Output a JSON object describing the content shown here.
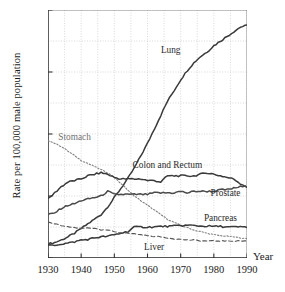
{
  "chart_data": {
    "type": "line",
    "title": "",
    "xlabel": "Year",
    "ylabel": "Rate per 100,000 male population",
    "xlim": [
      1930,
      1990
    ],
    "ylim": [
      0,
      80
    ],
    "xticks": [
      1930,
      1940,
      1950,
      1960,
      1970,
      1980,
      1990
    ],
    "yticks": [
      0,
      20,
      40,
      60,
      80
    ],
    "grid": "dotted gridlines every 5 years and every 10 rate units",
    "legend": "inline labels placed next to each curve",
    "series": [
      {
        "name": "Lung",
        "style": "solid",
        "color": "#3a3a3a",
        "label_x": 1967,
        "label_y": 66,
        "x": [
          1930,
          1932,
          1934,
          1936,
          1938,
          1940,
          1942,
          1944,
          1946,
          1948,
          1950,
          1952,
          1954,
          1956,
          1958,
          1960,
          1962,
          1964,
          1966,
          1968,
          1970,
          1972,
          1974,
          1976,
          1978,
          1980,
          1982,
          1984,
          1986,
          1988,
          1990
        ],
        "values": [
          4.5,
          5.0,
          5.8,
          6.8,
          8.0,
          9.5,
          11.0,
          12.5,
          14.0,
          16.5,
          19.5,
          22.5,
          25.5,
          29.0,
          33.0,
          37.0,
          41.5,
          46.0,
          50.5,
          54.0,
          57.5,
          60.5,
          63.0,
          65.0,
          66.5,
          68.5,
          70.0,
          71.5,
          73.0,
          74.5,
          75.0
        ]
      },
      {
        "name": "Stomach",
        "style": "dotted",
        "color": "#808080",
        "label_x": 1938,
        "label_y": 38,
        "x": [
          1930,
          1932,
          1934,
          1936,
          1938,
          1940,
          1942,
          1944,
          1946,
          1948,
          1950,
          1952,
          1954,
          1956,
          1958,
          1960,
          1962,
          1964,
          1966,
          1968,
          1970,
          1972,
          1974,
          1976,
          1978,
          1980,
          1982,
          1984,
          1986,
          1988,
          1990
        ],
        "values": [
          38.0,
          37.0,
          36.0,
          34.5,
          33.0,
          31.5,
          30.5,
          29.5,
          28.5,
          27.5,
          26.0,
          24.0,
          22.0,
          20.0,
          18.5,
          17.0,
          15.5,
          14.0,
          12.5,
          11.5,
          10.5,
          9.8,
          9.0,
          8.5,
          8.0,
          7.5,
          7.2,
          7.0,
          6.8,
          6.5,
          6.2
        ]
      },
      {
        "name": "Colon and Rectum",
        "style": "solid",
        "color": "#3a3a3a",
        "label_x": 1966,
        "label_y": 29,
        "x": [
          1930,
          1932,
          1934,
          1936,
          1938,
          1940,
          1942,
          1944,
          1946,
          1948,
          1950,
          1952,
          1954,
          1956,
          1958,
          1960,
          1962,
          1964,
          1966,
          1968,
          1970,
          1972,
          1974,
          1976,
          1978,
          1980,
          1982,
          1984,
          1986,
          1988,
          1990
        ],
        "values": [
          19.0,
          21.0,
          23.0,
          24.5,
          25.0,
          25.5,
          26.5,
          27.0,
          27.5,
          27.0,
          26.0,
          25.5,
          25.5,
          25.5,
          25.5,
          25.0,
          25.0,
          24.5,
          26.5,
          26.5,
          26.5,
          26.5,
          26.5,
          27.0,
          27.5,
          27.0,
          26.5,
          26.0,
          25.5,
          24.0,
          23.0
        ]
      },
      {
        "name": "Prostate",
        "style": "solid",
        "color": "#4a4a4a",
        "label_x": 1979,
        "label_y": 20,
        "x": [
          1930,
          1932,
          1934,
          1936,
          1938,
          1940,
          1942,
          1944,
          1946,
          1948,
          1950,
          1952,
          1954,
          1956,
          1958,
          1960,
          1962,
          1964,
          1966,
          1968,
          1970,
          1972,
          1974,
          1976,
          1978,
          1980,
          1982,
          1984,
          1986,
          1988,
          1990
        ],
        "values": [
          14.0,
          14.5,
          16.0,
          17.0,
          17.5,
          18.5,
          19.0,
          19.5,
          20.0,
          21.5,
          20.5,
          20.5,
          20.5,
          20.5,
          20.5,
          20.5,
          21.0,
          21.0,
          21.0,
          21.0,
          21.5,
          21.0,
          21.5,
          21.5,
          21.5,
          21.5,
          22.0,
          22.0,
          22.5,
          23.0,
          23.0
        ]
      },
      {
        "name": "Pancreas",
        "style": "solid",
        "color": "#3a3a3a",
        "label_x": 1977,
        "label_y": 12,
        "x": [
          1930,
          1932,
          1934,
          1936,
          1938,
          1940,
          1942,
          1944,
          1946,
          1948,
          1950,
          1952,
          1954,
          1956,
          1958,
          1960,
          1962,
          1964,
          1966,
          1968,
          1970,
          1972,
          1974,
          1976,
          1978,
          1980,
          1982,
          1984,
          1986,
          1988,
          1990
        ],
        "values": [
          4.0,
          4.2,
          4.5,
          4.8,
          5.2,
          5.8,
          6.0,
          6.5,
          6.8,
          7.0,
          7.5,
          8.0,
          8.5,
          10.0,
          10.0,
          10.0,
          10.0,
          10.2,
          10.2,
          10.3,
          10.5,
          10.5,
          10.5,
          10.3,
          10.3,
          10.2,
          10.2,
          10.0,
          10.0,
          10.0,
          10.0
        ]
      },
      {
        "name": "Liver",
        "style": "dashed",
        "color": "#555555",
        "label_x": 1962,
        "label_y": 2.5,
        "x": [
          1930,
          1932,
          1934,
          1936,
          1938,
          1940,
          1942,
          1944,
          1946,
          1948,
          1950,
          1952,
          1954,
          1956,
          1958,
          1960,
          1962,
          1964,
          1966,
          1968,
          1970,
          1972,
          1974,
          1976,
          1978,
          1980,
          1982,
          1984,
          1986,
          1988,
          1990
        ],
        "values": [
          11.5,
          11.0,
          10.5,
          10.0,
          9.8,
          9.5,
          9.8,
          9.5,
          9.0,
          9.0,
          8.5,
          8.2,
          8.0,
          7.8,
          7.5,
          7.2,
          7.0,
          6.8,
          6.5,
          6.2,
          6.0,
          5.8,
          5.8,
          5.5,
          5.5,
          5.5,
          5.5,
          5.5,
          5.5,
          5.5,
          5.5
        ]
      }
    ]
  }
}
